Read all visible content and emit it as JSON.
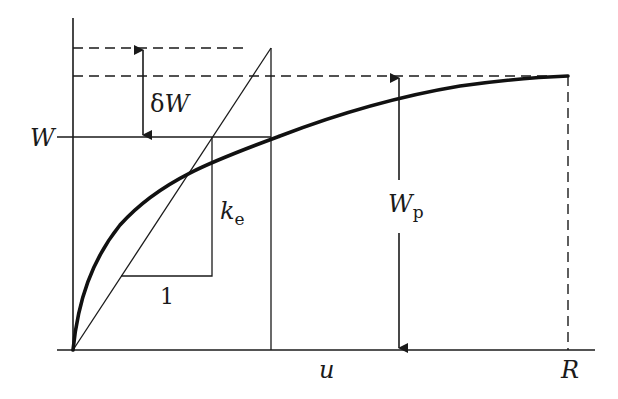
{
  "diagram": {
    "type": "force-displacement curve with elastic stiffness",
    "labels": {
      "W": "W",
      "delta_W_prefix": "δ",
      "delta_W_var": "W",
      "W_p_main": "W",
      "W_p_sub": "p",
      "k_e_main": "k",
      "k_e_sub": "e",
      "one": "1",
      "u": "u",
      "R": "R"
    },
    "colors": {
      "line": "#1a1a1a",
      "background": "#ffffff"
    }
  }
}
